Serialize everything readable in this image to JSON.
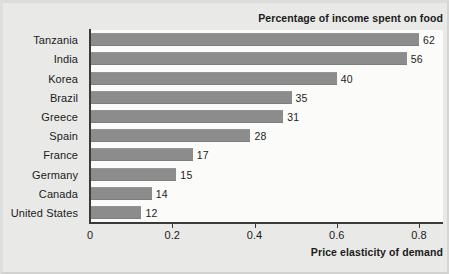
{
  "chart_data": {
    "type": "bar",
    "orientation": "horizontal",
    "title": "Percentage of income spent on food",
    "xlabel": "Price elasticity of demand",
    "ylabel": "",
    "categories": [
      "Tanzania",
      "India",
      "Korea",
      "Brazil",
      "Greece",
      "Spain",
      "France",
      "Germany",
      "Canada",
      "United States"
    ],
    "values": [
      0.8,
      0.77,
      0.6,
      0.49,
      0.47,
      0.39,
      0.25,
      0.21,
      0.15,
      0.125
    ],
    "data_labels": [
      "62",
      "56",
      "40",
      "35",
      "31",
      "28",
      "17",
      "15",
      "14",
      "12"
    ],
    "data_label_meaning": "Percentage of income spent on food",
    "xlim": [
      0,
      0.85
    ],
    "xticks": [
      0,
      0.2,
      0.4,
      0.6,
      0.8
    ],
    "xtick_labels": [
      "0",
      "0.2",
      "0.4",
      "0.6",
      "0.8"
    ],
    "grid": false,
    "legend": false,
    "bar_color": "#8c8c8c",
    "axis_color": "#3a3a3a",
    "text_color": "#1b1b1b",
    "background": "#e9e9e7",
    "plot_background": "#fbfbfa",
    "rows": [
      {
        "category": "Tanzania",
        "elasticity": 0.8,
        "percent_income_on_food": "62"
      },
      {
        "category": "India",
        "elasticity": 0.77,
        "percent_income_on_food": "56"
      },
      {
        "category": "Korea",
        "elasticity": 0.6,
        "percent_income_on_food": "40"
      },
      {
        "category": "Brazil",
        "elasticity": 0.49,
        "percent_income_on_food": "35"
      },
      {
        "category": "Greece",
        "elasticity": 0.47,
        "percent_income_on_food": "31"
      },
      {
        "category": "Spain",
        "elasticity": 0.39,
        "percent_income_on_food": "28"
      },
      {
        "category": "France",
        "elasticity": 0.25,
        "percent_income_on_food": "17"
      },
      {
        "category": "Germany",
        "elasticity": 0.21,
        "percent_income_on_food": "15"
      },
      {
        "category": "Canada",
        "elasticity": 0.15,
        "percent_income_on_food": "14"
      },
      {
        "category": "United States",
        "elasticity": 0.125,
        "percent_income_on_food": "12"
      }
    ]
  }
}
